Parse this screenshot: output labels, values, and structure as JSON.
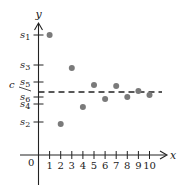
{
  "chart_data": {
    "type": "scatter",
    "title": "",
    "xlabel": "x",
    "ylabel": "y",
    "origin_label": "0",
    "x_ticks": [
      "1",
      "2",
      "3",
      "4",
      "5",
      "6",
      "7",
      "8",
      "9",
      "10"
    ],
    "y_tick_labels": [
      "s1",
      "s3",
      "s5",
      "c",
      "s6",
      "s4",
      "s2"
    ],
    "y_ticks": [
      {
        "label": "s",
        "sub": "1",
        "value": 120
      },
      {
        "label": "s",
        "sub": "3",
        "value": 90
      },
      {
        "label": "s",
        "sub": "5",
        "value": 73
      },
      {
        "label": "s",
        "sub": "6",
        "value": 58
      },
      {
        "label": "s",
        "sub": "4",
        "value": 51
      },
      {
        "label": "s",
        "sub": "2",
        "value": 33
      }
    ],
    "reference_line": {
      "label": "c",
      "value": 63,
      "style": "dashed"
    },
    "points": [
      {
        "x": 1,
        "y": 120
      },
      {
        "x": 2,
        "y": 31
      },
      {
        "x": 3,
        "y": 87
      },
      {
        "x": 4,
        "y": 48
      },
      {
        "x": 5,
        "y": 70
      },
      {
        "x": 6,
        "y": 56
      },
      {
        "x": 7,
        "y": 69
      },
      {
        "x": 8,
        "y": 58
      },
      {
        "x": 9,
        "y": 64
      },
      {
        "x": 10,
        "y": 60
      }
    ],
    "xlim": [
      0,
      11
    ],
    "ylim": [
      0,
      131
    ],
    "grid": false,
    "legend": null,
    "point_color": "#7a7a7a",
    "axis_color": "#222222"
  }
}
